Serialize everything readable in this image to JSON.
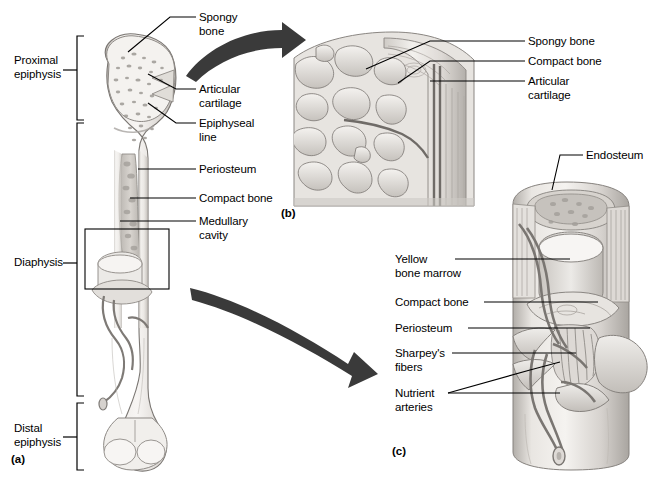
{
  "figure": {
    "panels": [
      {
        "tag": "(a)",
        "x": 11,
        "y": 453,
        "name": "panel-a-tag"
      },
      {
        "tag": "(b)",
        "x": 281,
        "y": 207,
        "name": "panel-b-tag"
      },
      {
        "tag": "(c)",
        "x": 392,
        "y": 445,
        "name": "panel-c-tag"
      }
    ]
  },
  "region_brackets": [
    {
      "id": "proximal-epiphysis",
      "label": "Proximal\nepiphysis",
      "label_x": 14,
      "label_y": 54,
      "top": 36,
      "bottom": 120,
      "tick": 70,
      "bracket_x": 77
    },
    {
      "id": "diaphysis",
      "label": "Diaphysis",
      "label_x": 14,
      "label_y": 258,
      "top": 123,
      "bottom": 396,
      "tick": 263,
      "bracket_x": 77
    },
    {
      "id": "distal-epiphysis",
      "label": "Distal\nepiphysis",
      "label_x": 14,
      "label_y": 422,
      "top": 403,
      "bottom": 470,
      "tick": 437,
      "bracket_x": 77
    }
  ],
  "panel_a_labels": [
    {
      "id": "spongy-bone",
      "text": "Spongy\nbone",
      "x": 199,
      "y": 12
    },
    {
      "id": "articular-cartilage",
      "text": "Articular\ncartilage",
      "x": 199,
      "y": 84
    },
    {
      "id": "epiphyseal-line",
      "text": "Epiphyseal\nline",
      "x": 199,
      "y": 118
    },
    {
      "id": "periosteum",
      "text": "Periosteum",
      "x": 199,
      "y": 164
    },
    {
      "id": "compact-bone",
      "text": "Compact bone",
      "x": 199,
      "y": 193
    },
    {
      "id": "medullary-cavity",
      "text": "Medullary\ncavity",
      "x": 199,
      "y": 215
    }
  ],
  "panel_b_labels": [
    {
      "id": "spongy-bone",
      "text": "Spongy bone",
      "x": 528,
      "y": 36
    },
    {
      "id": "compact-bone",
      "text": "Compact bone",
      "x": 528,
      "y": 56
    },
    {
      "id": "articular-cartilage",
      "text": "Articular\ncartilage",
      "x": 528,
      "y": 76
    }
  ],
  "panel_c_labels": [
    {
      "id": "endosteum",
      "text": "Endosteum",
      "x": 586,
      "y": 150
    },
    {
      "id": "yellow-bone-marrow",
      "text": "Yellow\nbone marrow",
      "x": 395,
      "y": 254
    },
    {
      "id": "compact-bone",
      "text": "Compact bone",
      "x": 395,
      "y": 297
    },
    {
      "id": "periosteum",
      "text": "Periosteum",
      "x": 395,
      "y": 323
    },
    {
      "id": "sharpeys-fibers",
      "text": "Sharpey's\nfibers",
      "x": 395,
      "y": 348
    },
    {
      "id": "nutrient-arteries",
      "text": "Nutrient\narteries",
      "x": 395,
      "y": 388
    }
  ],
  "colors": {
    "ink": "#000000",
    "background": "#ffffff",
    "arrow": "#3a3a3a",
    "bone_outline": "#6e6e6e",
    "bone_light": "#f2f0ee",
    "bone_mid": "#d9d6d2",
    "bone_shade": "#b5b1ad",
    "marrow": "#cfcbc6",
    "vessel": "#8a8a8a"
  },
  "connector_count": 17,
  "zoom_boxes": [
    {
      "id": "diaphysis-detail-box",
      "x": 85,
      "y": 229,
      "w": 84,
      "h": 60
    }
  ]
}
